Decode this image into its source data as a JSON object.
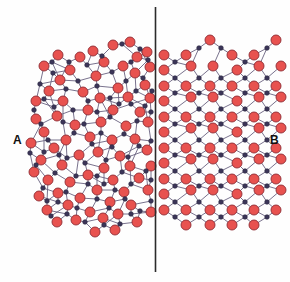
{
  "figure": {
    "width": 290,
    "height": 282,
    "background_color": "#fefefe"
  },
  "labels": {
    "left": "A",
    "right": "B",
    "left_meaning": "amorphous region",
    "right_meaning": "crystalline region"
  },
  "divider": {
    "name": "vertical-divider-line",
    "x": 155.5,
    "y1": 7,
    "y2": 272,
    "color": "#2b2b2b",
    "width": 1.6
  },
  "style": {
    "large_atom_fill": "#e8524f",
    "large_atom_stroke": "#8e2b33",
    "large_atom_radius": 5.0,
    "small_atom_fill": "#3b3558",
    "small_atom_stroke": "#2a2640",
    "small_atom_radius": 2.3,
    "bond_color": "#6a6280",
    "bond_width": 0.9
  },
  "legend_semantics": {
    "large_atom": "oxygen",
    "small_atom": "silicon"
  },
  "chart_data": {
    "type": "scatter",
    "xlabel": "",
    "ylabel": "",
    "xlim": [
      0,
      290
    ],
    "ylim": [
      0,
      282
    ],
    "grid": false,
    "legend": "none",
    "annotations": [
      {
        "text": "A",
        "x": 17,
        "y": 140,
        "region": "amorphous"
      },
      {
        "text": "B",
        "x": 274,
        "y": 140,
        "region": "crystalline"
      }
    ],
    "series": [
      {
        "name": "oxygen-amorphous",
        "marker": "circle-large",
        "color": "#e8524f",
        "points": [
          [
            113,
            45
          ],
          [
            130,
            42
          ],
          [
            93,
            51
          ],
          [
            137,
            57
          ],
          [
            58,
            55
          ],
          [
            80,
            57
          ],
          [
            147,
            52
          ],
          [
            104,
            62
          ],
          [
            70,
            70
          ],
          [
            123,
            66
          ],
          [
            44,
            66
          ],
          [
            96,
            76
          ],
          [
            135,
            73
          ],
          [
            150,
            67
          ],
          [
            60,
            80
          ],
          [
            118,
            88
          ],
          [
            145,
            85
          ],
          [
            83,
            92
          ],
          [
            49,
            91
          ],
          [
            36,
            101
          ],
          [
            100,
            98
          ],
          [
            128,
            97
          ],
          [
            150,
            98
          ],
          [
            63,
            101
          ],
          [
            88,
            110
          ],
          [
            113,
            110
          ],
          [
            140,
            112
          ],
          [
            36,
            119
          ],
          [
            57,
            116
          ],
          [
            101,
            122
          ],
          [
            75,
            125
          ],
          [
            126,
            126
          ],
          [
            148,
            122
          ],
          [
            44,
            132
          ],
          [
            90,
            137
          ],
          [
            112,
            140
          ],
          [
            135,
            139
          ],
          [
            66,
            140
          ],
          [
            31,
            143
          ],
          [
            54,
            148
          ],
          [
            98,
            152
          ],
          [
            120,
            156
          ],
          [
            147,
            150
          ],
          [
            79,
            155
          ],
          [
            41,
            160
          ],
          [
            62,
            165
          ],
          [
            104,
            168
          ],
          [
            130,
            166
          ],
          [
            151,
            166
          ],
          [
            34,
            172
          ],
          [
            88,
            175
          ],
          [
            113,
            180
          ],
          [
            48,
            180
          ],
          [
            70,
            182
          ],
          [
            139,
            178
          ],
          [
            97,
            190
          ],
          [
            58,
            193
          ],
          [
            124,
            192
          ],
          [
            39,
            196
          ],
          [
            80,
            198
          ],
          [
            148,
            190
          ],
          [
            110,
            202
          ],
          [
            68,
            205
          ],
          [
            90,
            212
          ],
          [
            131,
            205
          ],
          [
            47,
            210
          ],
          [
            103,
            218
          ],
          [
            118,
            214
          ],
          [
            76,
            220
          ],
          [
            57,
            222
          ],
          [
            95,
            232
          ],
          [
            137,
            222
          ],
          [
            115,
            230
          ],
          [
            151,
            212
          ]
        ]
      },
      {
        "name": "silicon-amorphous",
        "marker": "circle-small",
        "color": "#3b3558",
        "points": [
          [
            122,
            44
          ],
          [
            102,
            56
          ],
          [
            69,
            62
          ],
          [
            140,
            49
          ],
          [
            87,
            65
          ],
          [
            52,
            62
          ],
          [
            131,
            62
          ],
          [
            112,
            72
          ],
          [
            148,
            60
          ],
          [
            53,
            73
          ],
          [
            78,
            81
          ],
          [
            126,
            81
          ],
          [
            97,
            86
          ],
          [
            143,
            78
          ],
          [
            40,
            84
          ],
          [
            66,
            89
          ],
          [
            110,
            98
          ],
          [
            136,
            91
          ],
          [
            88,
            101
          ],
          [
            44,
            99
          ],
          [
            152,
            91
          ],
          [
            73,
            110
          ],
          [
            119,
            104
          ],
          [
            97,
            112
          ],
          [
            34,
            110
          ],
          [
            54,
            107
          ],
          [
            131,
            104
          ],
          [
            145,
            106
          ],
          [
            63,
            122
          ],
          [
            41,
            124
          ],
          [
            110,
            117
          ],
          [
            84,
            124
          ],
          [
            137,
            121
          ],
          [
            151,
            112
          ],
          [
            101,
            133
          ],
          [
            124,
            134
          ],
          [
            74,
            133
          ],
          [
            48,
            140
          ],
          [
            92,
            144
          ],
          [
            30,
            153
          ],
          [
            59,
            155
          ],
          [
            112,
            147
          ],
          [
            139,
            146
          ],
          [
            151,
            141
          ],
          [
            85,
            163
          ],
          [
            44,
            152
          ],
          [
            67,
            158
          ],
          [
            106,
            160
          ],
          [
            128,
            157
          ],
          [
            36,
            165
          ],
          [
            97,
            176
          ],
          [
            122,
            172
          ],
          [
            55,
            173
          ],
          [
            76,
            176
          ],
          [
            146,
            171
          ],
          [
            104,
            184
          ],
          [
            66,
            192
          ],
          [
            88,
            184
          ],
          [
            131,
            184
          ],
          [
            43,
            188
          ],
          [
            115,
            190
          ],
          [
            151,
            180
          ],
          [
            58,
            202
          ],
          [
            97,
            199
          ],
          [
            77,
            208
          ],
          [
            125,
            199
          ],
          [
            47,
            201
          ],
          [
            109,
            208
          ],
          [
            140,
            211
          ],
          [
            67,
            214
          ],
          [
            85,
            222
          ],
          [
            51,
            216
          ],
          [
            104,
            225
          ],
          [
            131,
            214
          ],
          [
            120,
            224
          ],
          [
            151,
            201
          ]
        ]
      },
      {
        "name": "oxygen-crystalline",
        "marker": "circle-large",
        "color": "#e8524f",
        "points": [
          [
            164,
            55
          ],
          [
            186,
            55
          ],
          [
            210,
            40
          ],
          [
            232,
            55
          ],
          [
            254,
            55
          ],
          [
            276,
            40
          ],
          [
            164,
            70
          ],
          [
            191,
            66
          ],
          [
            213,
            66
          ],
          [
            237,
            70
          ],
          [
            259,
            66
          ],
          [
            281,
            66
          ],
          [
            164,
            86
          ],
          [
            186,
            86
          ],
          [
            210,
            86
          ],
          [
            232,
            86
          ],
          [
            254,
            86
          ],
          [
            276,
            86
          ],
          [
            164,
            101
          ],
          [
            191,
            97
          ],
          [
            213,
            97
          ],
          [
            237,
            101
          ],
          [
            259,
            97
          ],
          [
            281,
            97
          ],
          [
            164,
            117
          ],
          [
            186,
            117
          ],
          [
            210,
            117
          ],
          [
            232,
            117
          ],
          [
            254,
            117
          ],
          [
            276,
            117
          ],
          [
            164,
            132
          ],
          [
            191,
            128
          ],
          [
            213,
            128
          ],
          [
            237,
            132
          ],
          [
            259,
            128
          ],
          [
            281,
            128
          ],
          [
            164,
            148
          ],
          [
            186,
            148
          ],
          [
            210,
            148
          ],
          [
            232,
            148
          ],
          [
            254,
            148
          ],
          [
            276,
            148
          ],
          [
            164,
            163
          ],
          [
            191,
            159
          ],
          [
            213,
            159
          ],
          [
            237,
            163
          ],
          [
            259,
            159
          ],
          [
            281,
            159
          ],
          [
            164,
            179
          ],
          [
            186,
            179
          ],
          [
            210,
            179
          ],
          [
            232,
            179
          ],
          [
            254,
            179
          ],
          [
            276,
            179
          ],
          [
            164,
            194
          ],
          [
            191,
            190
          ],
          [
            213,
            190
          ],
          [
            237,
            194
          ],
          [
            259,
            190
          ],
          [
            281,
            190
          ],
          [
            164,
            210
          ],
          [
            186,
            210
          ],
          [
            210,
            210
          ],
          [
            232,
            210
          ],
          [
            254,
            210
          ],
          [
            276,
            210
          ],
          [
            186,
            225
          ],
          [
            210,
            225
          ],
          [
            232,
            225
          ],
          [
            254,
            225
          ]
        ]
      },
      {
        "name": "silicon-crystalline",
        "marker": "circle-small",
        "color": "#3b3558",
        "points": [
          [
            175,
            62
          ],
          [
            199,
            48
          ],
          [
            221,
            48
          ],
          [
            245,
            62
          ],
          [
            267,
            48
          ],
          [
            175,
            78
          ],
          [
            199,
            78
          ],
          [
            221,
            78
          ],
          [
            245,
            78
          ],
          [
            267,
            78
          ],
          [
            175,
            93
          ],
          [
            199,
            93
          ],
          [
            221,
            93
          ],
          [
            245,
            93
          ],
          [
            267,
            93
          ],
          [
            175,
            109
          ],
          [
            199,
            109
          ],
          [
            221,
            109
          ],
          [
            245,
            109
          ],
          [
            267,
            109
          ],
          [
            175,
            124
          ],
          [
            199,
            124
          ],
          [
            221,
            124
          ],
          [
            245,
            124
          ],
          [
            267,
            124
          ],
          [
            175,
            140
          ],
          [
            199,
            140
          ],
          [
            221,
            140
          ],
          [
            245,
            140
          ],
          [
            267,
            140
          ],
          [
            175,
            155
          ],
          [
            199,
            155
          ],
          [
            221,
            155
          ],
          [
            245,
            155
          ],
          [
            267,
            155
          ],
          [
            175,
            171
          ],
          [
            199,
            171
          ],
          [
            221,
            171
          ],
          [
            245,
            171
          ],
          [
            267,
            171
          ],
          [
            175,
            186
          ],
          [
            199,
            186
          ],
          [
            221,
            186
          ],
          [
            245,
            186
          ],
          [
            267,
            186
          ],
          [
            175,
            202
          ],
          [
            199,
            202
          ],
          [
            221,
            202
          ],
          [
            245,
            202
          ],
          [
            267,
            202
          ],
          [
            175,
            217
          ],
          [
            199,
            217
          ],
          [
            221,
            217
          ],
          [
            245,
            217
          ],
          [
            267,
            217
          ]
        ]
      }
    ]
  }
}
